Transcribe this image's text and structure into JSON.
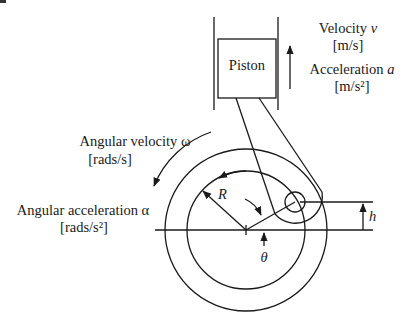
{
  "diagram": {
    "piston": {
      "label": "Piston"
    },
    "velocity": {
      "name": "Velocity",
      "symbol": "v",
      "unit": "[m/s]"
    },
    "acceleration": {
      "name": "Acceleration",
      "symbol": "a",
      "unit": "[m/s²]"
    },
    "angular_velocity": {
      "name": "Angular velocity",
      "symbol": "ω",
      "unit": "[rads/s]"
    },
    "angular_acceleration": {
      "name": "Angular acceleration",
      "symbol": "α",
      "unit": "[rads/s²]"
    },
    "radius": {
      "symbol": "R"
    },
    "height": {
      "symbol": "h"
    },
    "angle": {
      "symbol": "θ"
    },
    "colors": {
      "ink": "#1a1a1a",
      "background": "#ffffff"
    }
  }
}
